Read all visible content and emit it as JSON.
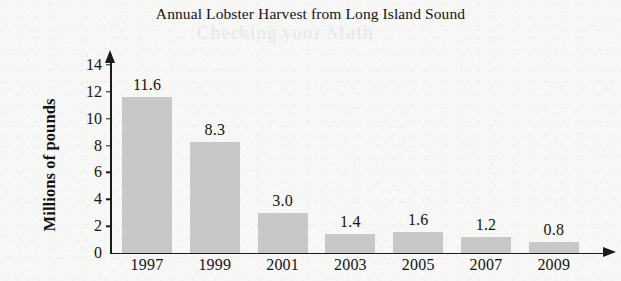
{
  "chart_data": {
    "type": "bar",
    "title": "Annual Lobster Harvest from Long Island Sound",
    "xlabel": "",
    "ylabel": "Millions of pounds",
    "categories": [
      "1997",
      "1999",
      "2001",
      "2003",
      "2005",
      "2007",
      "2009"
    ],
    "values": [
      11.6,
      8.3,
      3.0,
      1.4,
      1.6,
      1.2,
      0.8
    ],
    "value_labels": [
      "11.6",
      "8.3",
      "3.0",
      "1.4",
      "1.6",
      "1.2",
      "0.8"
    ],
    "ylim": [
      0,
      14
    ],
    "y_ticks": [
      0,
      2,
      4,
      6,
      8,
      10,
      12,
      14
    ],
    "y_tick_labels": [
      "0",
      "2",
      "4",
      "6",
      "8",
      "10",
      "12",
      "14"
    ],
    "grid": false,
    "legend": "none",
    "bar_color": "#c7c7c6",
    "axis_color": "#1b1b1b",
    "text_color": "#131313",
    "background_color": "#f7f7f6"
  },
  "ghost_text": {
    "heading": "Checking your Math",
    "line_1": "",
    "line_2": "",
    "line_3": "",
    "line_4": ""
  }
}
